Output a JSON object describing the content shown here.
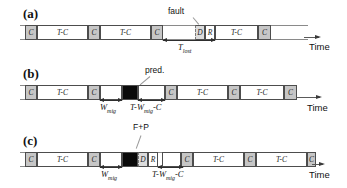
{
  "time_label": "Time",
  "colors": {
    "c_fill": "#c6c6c6",
    "d_fill": "#dcdcdc",
    "black_fill": "#0a0a0a",
    "band_line": "#8a8a8a"
  },
  "panels": [
    {
      "label": "(a)",
      "annotation": "fault",
      "band": {
        "x": 20,
        "y": 25,
        "w": 288
      },
      "segments": [
        {
          "type": "c",
          "label": "C",
          "x": 25,
          "w": 12
        },
        {
          "type": "tc",
          "label": "T-C",
          "x": 37,
          "w": 51
        },
        {
          "type": "c",
          "label": "C",
          "x": 88,
          "w": 12
        },
        {
          "type": "tc",
          "label": "T-C",
          "x": 100,
          "w": 51
        },
        {
          "type": "c",
          "label": "C",
          "x": 151,
          "w": 12
        },
        {
          "type": "d",
          "label": "D",
          "x": 195,
          "w": 10
        },
        {
          "type": "r",
          "label": "R",
          "x": 205,
          "w": 10
        },
        {
          "type": "tc",
          "label": "T-C",
          "x": 215,
          "w": 43
        },
        {
          "type": "c",
          "label": "C",
          "x": 258,
          "w": 13
        }
      ],
      "measures": [
        {
          "pre": "T",
          "sub": "lost",
          "post": "",
          "x": 163,
          "y": 40,
          "w": 52,
          "label_x": 178,
          "label_y": 43
        }
      ]
    },
    {
      "label": "(b)",
      "annotation": "pred.",
      "band": {
        "x": 20,
        "y": 85,
        "w": 277
      },
      "segments": [
        {
          "type": "c",
          "label": "C",
          "x": 25,
          "w": 12
        },
        {
          "type": "tc",
          "label": "T-C",
          "x": 37,
          "w": 51
        },
        {
          "type": "c",
          "label": "C",
          "x": 88,
          "w": 12
        },
        {
          "type": "white",
          "label": "",
          "x": 100,
          "w": 22
        },
        {
          "type": "black",
          "label": "",
          "x": 122,
          "w": 16
        },
        {
          "type": "white",
          "label": "",
          "x": 138,
          "w": 27
        },
        {
          "type": "c",
          "label": "C",
          "x": 165,
          "w": 12
        },
        {
          "type": "tc",
          "label": "T-C",
          "x": 177,
          "w": 51
        },
        {
          "type": "c",
          "label": "C",
          "x": 228,
          "w": 12
        },
        {
          "type": "tc",
          "label": "T-C",
          "x": 240,
          "w": 44
        },
        {
          "type": "c",
          "label": "C",
          "x": 284,
          "w": 13
        }
      ],
      "measures": [
        {
          "pre": "W",
          "sub": "mig",
          "post": "",
          "x": 100,
          "y": 100,
          "w": 22,
          "label_x": 100,
          "label_y": 103
        },
        {
          "pre": "T-W",
          "sub": "mig",
          "post": "-C",
          "x": 138,
          "y": 100,
          "w": 27,
          "label_x": 130,
          "label_y": 103
        }
      ]
    },
    {
      "label": "(c)",
      "annotation": "F+P",
      "band": {
        "x": 20,
        "y": 152,
        "w": 296
      },
      "segments": [
        {
          "type": "c",
          "label": "C",
          "x": 25,
          "w": 12
        },
        {
          "type": "tc",
          "label": "T-C",
          "x": 37,
          "w": 51
        },
        {
          "type": "c",
          "label": "C",
          "x": 88,
          "w": 12
        },
        {
          "type": "white",
          "label": "",
          "x": 100,
          "w": 22
        },
        {
          "type": "black",
          "label": "",
          "x": 122,
          "w": 16
        },
        {
          "type": "d",
          "label": "D",
          "x": 138,
          "w": 10
        },
        {
          "type": "r",
          "label": "R",
          "x": 148,
          "w": 10
        },
        {
          "type": "white",
          "label": "",
          "x": 162,
          "w": 19
        },
        {
          "type": "c",
          "label": "C",
          "x": 181,
          "w": 12
        },
        {
          "type": "tc",
          "label": "T-C",
          "x": 193,
          "w": 51
        },
        {
          "type": "c",
          "label": "C",
          "x": 244,
          "w": 12
        },
        {
          "type": "tc",
          "label": "T-C",
          "x": 256,
          "w": 51
        },
        {
          "type": "c",
          "label": "C",
          "x": 307,
          "w": 9
        }
      ],
      "measures": [
        {
          "pre": "W",
          "sub": "mig",
          "post": "",
          "x": 100,
          "y": 167,
          "w": 22,
          "label_x": 101,
          "label_y": 170
        },
        {
          "pre": "T-W",
          "sub": "mig",
          "post": "-C",
          "x": 158,
          "y": 167,
          "w": 25,
          "label_x": 152,
          "label_y": 170
        }
      ]
    }
  ]
}
